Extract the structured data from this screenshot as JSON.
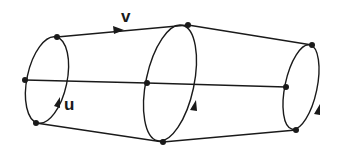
{
  "diagram": {
    "labels": {
      "v": "v",
      "u": "u"
    },
    "colors": {
      "ink": "#1a1a1a",
      "background": "#ffffff"
    },
    "loops": [
      "left-loop",
      "middle-loop",
      "right-loop"
    ],
    "edges": [
      "top-edge",
      "middle-edge",
      "bottom-edge"
    ]
  }
}
